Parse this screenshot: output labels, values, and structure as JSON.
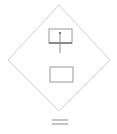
{
  "canvas": {
    "width": 117,
    "height": 134,
    "background": "#ffffff",
    "title": "Diamond outline diagram with two rectangles and an equals mark"
  },
  "style": {
    "stroke_light": "#c9c9c9",
    "stroke_medium": "#b0b0b0",
    "stroke_dark": "#6e6e6e",
    "fill_none": "none",
    "stroke_width_thin": 0.8,
    "stroke_width_medium": 1,
    "stroke_width_thick": 1.4
  },
  "shapes": {
    "diamond": {
      "name": "diamond-outline",
      "points": "59,5 110,60 59,111 8,60",
      "stroke": "#c9c9c9",
      "stroke_width": 0.9,
      "fill": "none"
    },
    "upper_rectangle": {
      "name": "upper-rectangle",
      "x": 49,
      "y": 29,
      "width": 23,
      "height": 14,
      "stroke": "#9a9a9a",
      "stroke_width": 1,
      "fill": "none"
    },
    "upper_rectangle_base": {
      "name": "upper-rectangle-base-line",
      "x1": 49,
      "y1": 43,
      "x2": 72,
      "y2": 43,
      "stroke": "#6e6e6e",
      "stroke_width": 1.4
    },
    "pointer_line": {
      "name": "pointer-line",
      "x1": 60,
      "y1": 32,
      "x2": 60,
      "y2": 53,
      "stroke": "#8d8d8d",
      "stroke_width": 1
    },
    "pointer_dot": {
      "name": "pointer-dot",
      "cx": 60,
      "cy": 33,
      "r": 0.9,
      "fill": "#5a5a5a"
    },
    "lower_rectangle": {
      "name": "lower-rectangle",
      "x": 50,
      "y": 67,
      "width": 23,
      "height": 15,
      "stroke": "#9a9a9a",
      "stroke_width": 1,
      "fill": "none"
    },
    "equals_mark": {
      "name": "equals-mark",
      "line_top": {
        "x1": 52,
        "y1": 120,
        "x2": 68,
        "y2": 120
      },
      "line_bottom": {
        "x1": 52,
        "y1": 124,
        "x2": 68,
        "y2": 124
      },
      "stroke": "#9a9a9a",
      "stroke_width": 1.2
    }
  },
  "labels": {
    "diamond": "diamond",
    "upper_rectangle": "upper rectangle",
    "lower_rectangle": "lower rectangle",
    "equals_mark": "equals mark"
  }
}
